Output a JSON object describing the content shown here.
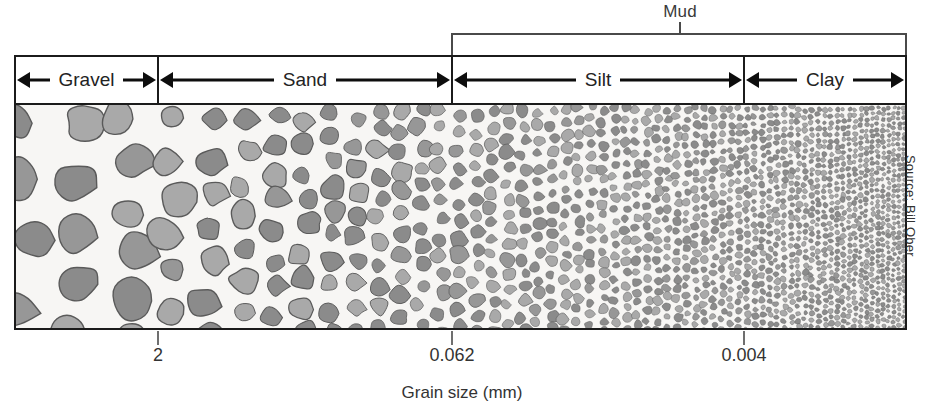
{
  "figure": {
    "axis_title": "Grain size (mm)",
    "source_credit": "Source: Bill Ober"
  },
  "group_bracket": {
    "label": "Mud",
    "covers": [
      "Silt",
      "Clay"
    ]
  },
  "classes": [
    {
      "label": "Gravel",
      "x_start_px": 14,
      "x_end_px": 158
    },
    {
      "label": "Sand",
      "x_start_px": 158,
      "x_end_px": 452
    },
    {
      "label": "Silt",
      "x_start_px": 452,
      "x_end_px": 744
    },
    {
      "label": "Clay",
      "x_start_px": 744,
      "x_end_px": 907
    }
  ],
  "ticks": [
    {
      "value": "2",
      "x_px": 158
    },
    {
      "value": "0.062",
      "x_px": 452
    },
    {
      "value": "0.004",
      "x_px": 744
    }
  ],
  "chart_data": {
    "type": "bar",
    "xlabel": "Grain size (mm)",
    "ylabel": "",
    "categories": [
      "Gravel",
      "Sand",
      "Silt",
      "Clay"
    ],
    "values": [
      1,
      1,
      1,
      1
    ],
    "boundaries_mm": [
      2,
      0.062,
      0.004
    ],
    "tick_labels": [
      "2",
      "0.062",
      "0.004"
    ],
    "grouping": {
      "Mud": [
        "Silt",
        "Clay"
      ]
    },
    "grid": false,
    "legend": "none",
    "annotations": [
      "Mud",
      "Source: Bill Ober"
    ]
  },
  "colors": {
    "ink": "#1b1b1b",
    "text": "#333333",
    "grain_fill_dark": "#8b8b8b",
    "grain_fill_light": "#a9a9a9",
    "grain_outline": "#5a5a5a",
    "panel_background": "#f7f6f4"
  }
}
